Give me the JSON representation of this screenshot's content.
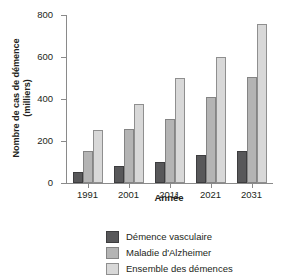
{
  "chart_data": {
    "type": "bar",
    "title": "",
    "xlabel": "Année",
    "ylabel": "Nombre de cas de démence",
    "ylabel_line2": "(milliers)",
    "categories": [
      "1991",
      "2001",
      "2011",
      "2021",
      "2031"
    ],
    "series": [
      {
        "name": "Démence vasculaire",
        "color": "#58585a",
        "values": [
          52,
          80,
          100,
          132,
          152
        ]
      },
      {
        "name": "Maladie d'Alzheimer",
        "color": "#b4b4b4",
        "values": [
          152,
          255,
          305,
          410,
          505
        ]
      },
      {
        "name": "Ensemble des démences",
        "color": "#d8d8d8",
        "values": [
          253,
          377,
          500,
          600,
          755
        ]
      }
    ],
    "ylim": [
      0,
      800
    ],
    "yticks": [
      0,
      200,
      400,
      600,
      800
    ],
    "ytick_labels": [
      "0",
      "200",
      "400",
      "600",
      "800"
    ],
    "grid": false,
    "legend_position": "bottom-center"
  }
}
